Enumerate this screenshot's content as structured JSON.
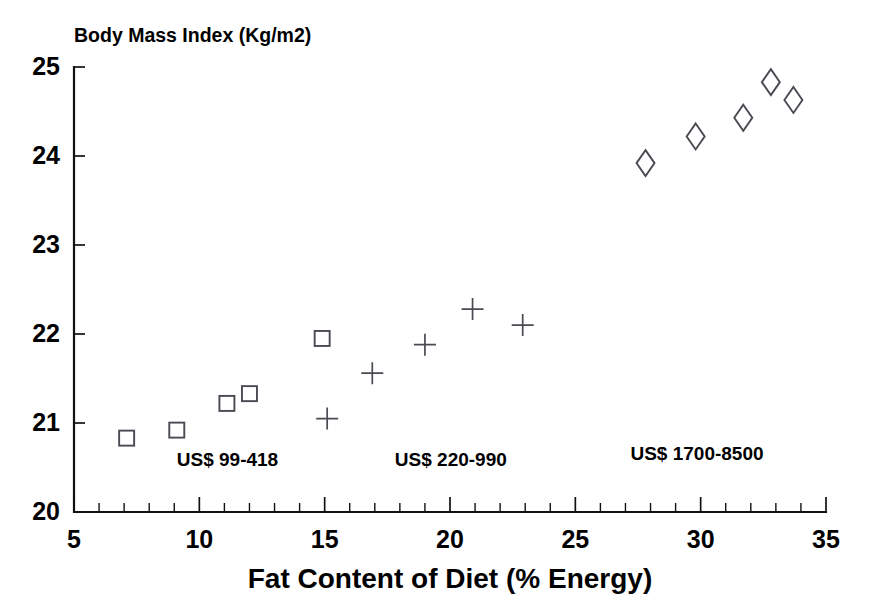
{
  "chart_data": {
    "type": "scatter",
    "title": "Body Mass Index (Kg/m2)",
    "xlabel": "Fat Content of Diet (% Energy)",
    "ylabel": "Body Mass Index (Kg/m2)",
    "xlim": [
      5,
      35
    ],
    "ylim": [
      20,
      25
    ],
    "xticks": [
      "5",
      "10",
      "15",
      "20",
      "25",
      "30",
      "35"
    ],
    "xtick_values": [
      5,
      10,
      15,
      20,
      25,
      30,
      35
    ],
    "yticks": [
      "20",
      "21",
      "22",
      "23",
      "24",
      "25"
    ],
    "ytick_values": [
      20,
      21,
      22,
      23,
      24,
      25
    ],
    "x_minor_tick_step": 1,
    "grid": false,
    "legend_position": "inline-annotations",
    "series": [
      {
        "name": "US$ 99-418",
        "marker": "square",
        "annotation": "US$ 99-418",
        "annotation_x": 9.1,
        "annotation_y": 20.52,
        "points": [
          {
            "x": 7.1,
            "y": 20.83
          },
          {
            "x": 9.1,
            "y": 20.92
          },
          {
            "x": 11.1,
            "y": 21.22
          },
          {
            "x": 12.0,
            "y": 21.33
          },
          {
            "x": 14.9,
            "y": 21.95
          }
        ]
      },
      {
        "name": "US$ 220-990",
        "marker": "plus",
        "annotation": "US$ 220-990",
        "annotation_x": 17.8,
        "annotation_y": 20.52,
        "points": [
          {
            "x": 15.1,
            "y": 21.05
          },
          {
            "x": 16.9,
            "y": 21.56
          },
          {
            "x": 19.0,
            "y": 21.88
          },
          {
            "x": 20.9,
            "y": 22.28
          },
          {
            "x": 22.9,
            "y": 22.1
          }
        ]
      },
      {
        "name": "US$ 1700-8500",
        "marker": "diamond",
        "annotation": "US$ 1700-8500",
        "annotation_x": 27.2,
        "annotation_y": 20.58,
        "points": [
          {
            "x": 27.8,
            "y": 23.92
          },
          {
            "x": 29.8,
            "y": 24.22
          },
          {
            "x": 31.7,
            "y": 24.43
          },
          {
            "x": 32.8,
            "y": 24.83
          },
          {
            "x": 33.7,
            "y": 24.63
          }
        ]
      }
    ],
    "colors": {
      "axis": "#111111",
      "marker": "#4a4a52",
      "background": "#ffffff",
      "text": "#000000"
    }
  }
}
